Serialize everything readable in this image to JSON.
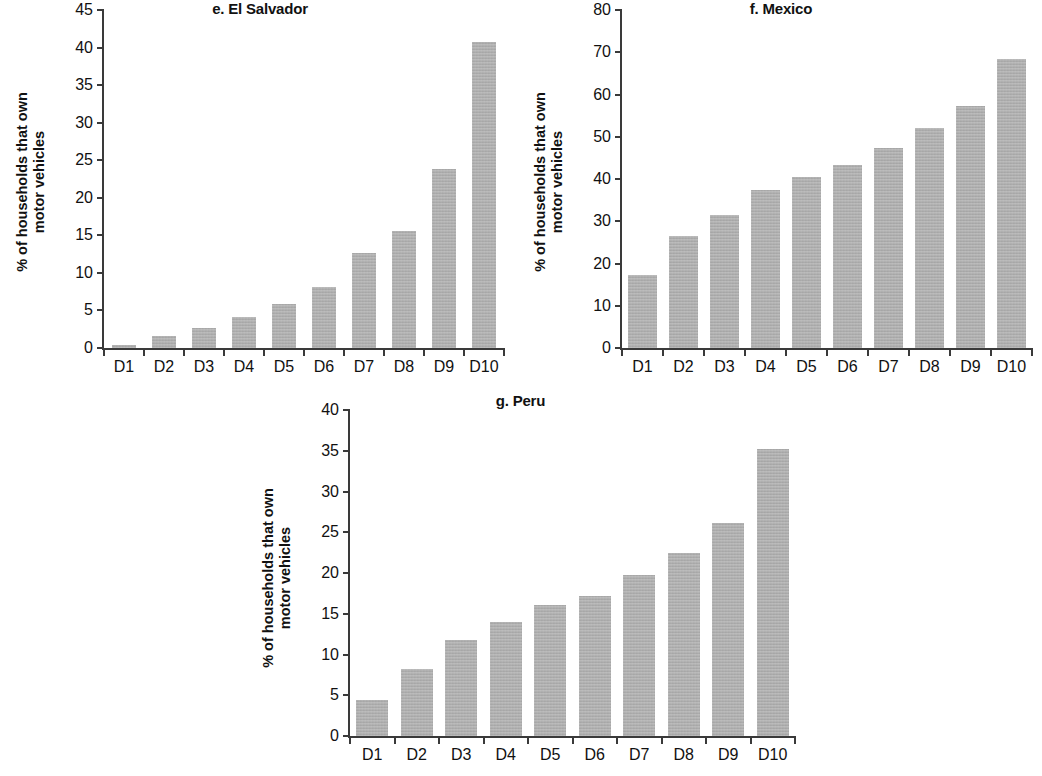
{
  "figure": {
    "background_color": "#ffffff",
    "bar_color": "#aaaaaa",
    "axis_color": "#3a3a3a"
  },
  "panels": [
    {
      "key": "el_salvador",
      "title": "e. El Salvador",
      "ylabel_line1": "% of households that own",
      "ylabel_line2": "motor vehicles"
    },
    {
      "key": "mexico",
      "title": "f. Mexico",
      "ylabel_line1": "% of households that own",
      "ylabel_line2": "motor vehicles"
    },
    {
      "key": "peru",
      "title": "g. Peru",
      "ylabel_line1": "% of households that own",
      "ylabel_line2": "motor vehicles"
    }
  ],
  "chart_data": [
    {
      "type": "bar",
      "title": "e. El Salvador",
      "xlabel": "",
      "ylabel": "% of households that own motor vehicles",
      "categories": [
        "D1",
        "D2",
        "D3",
        "D4",
        "D5",
        "D6",
        "D7",
        "D8",
        "D9",
        "D10"
      ],
      "values": [
        0.4,
        1.6,
        2.6,
        4.1,
        5.9,
        8.1,
        12.6,
        15.6,
        23.8,
        40.8
      ],
      "ylim": [
        0,
        45
      ],
      "yticks": [
        0,
        5,
        10,
        15,
        20,
        25,
        30,
        35,
        40,
        45
      ],
      "ytick_labels": [
        "0",
        "5",
        "10",
        "15",
        "20",
        "25",
        "30",
        "35",
        "40",
        "45"
      ],
      "grid": false,
      "legend": "none"
    },
    {
      "type": "bar",
      "title": "f. Mexico",
      "xlabel": "",
      "ylabel": "% of households that own motor vehicles",
      "categories": [
        "D1",
        "D2",
        "D3",
        "D4",
        "D5",
        "D6",
        "D7",
        "D8",
        "D9",
        "D10"
      ],
      "values": [
        17.2,
        26.5,
        31.5,
        37.3,
        40.5,
        43.4,
        47.3,
        52.0,
        57.3,
        68.5
      ],
      "ylim": [
        0,
        80
      ],
      "yticks": [
        0,
        10,
        20,
        30,
        40,
        50,
        60,
        70,
        80
      ],
      "ytick_labels": [
        "0",
        "10",
        "20",
        "30",
        "40",
        "50",
        "60",
        "70",
        "80"
      ],
      "grid": false,
      "legend": "none"
    },
    {
      "type": "bar",
      "title": "g. Peru",
      "xlabel": "",
      "ylabel": "% of households that own motor vehicles",
      "categories": [
        "D1",
        "D2",
        "D3",
        "D4",
        "D5",
        "D6",
        "D7",
        "D8",
        "D9",
        "D10"
      ],
      "values": [
        4.4,
        8.2,
        11.8,
        14.0,
        16.1,
        17.2,
        19.8,
        22.4,
        26.1,
        35.2
      ],
      "ylim": [
        0,
        40
      ],
      "yticks": [
        0,
        5,
        10,
        15,
        20,
        25,
        30,
        35,
        40
      ],
      "ytick_labels": [
        "0",
        "5",
        "10",
        "15",
        "20",
        "25",
        "30",
        "35",
        "40"
      ],
      "grid": false,
      "legend": "none"
    }
  ]
}
